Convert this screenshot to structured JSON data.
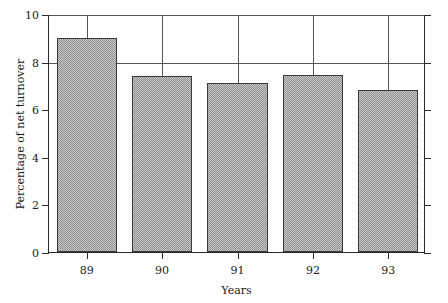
{
  "chart_data": {
    "type": "bar",
    "title": "",
    "subtitle": "",
    "xlabel": "Years",
    "ylabel": "Percentage of net turnover",
    "categories": [
      "89",
      "90",
      "91",
      "92",
      "93"
    ],
    "values": [
      9.0,
      7.4,
      7.1,
      7.45,
      6.8
    ],
    "series": [
      {
        "name": "Percentage of net turnover",
        "values": [
          9.0,
          7.4,
          7.1,
          7.45,
          6.8
        ]
      }
    ],
    "ylim": [
      0,
      10
    ],
    "yticks": [
      0,
      2,
      4,
      6,
      8,
      10
    ],
    "ytick_labels": [
      "0",
      "2",
      "4",
      "6",
      "8",
      "10"
    ],
    "xtick_labels": [
      "89",
      "90",
      "91",
      "92",
      "93"
    ],
    "grid": "both",
    "gridlines_horizontal": [
      8,
      10
    ],
    "gridlines_vertical": [
      "89",
      "90",
      "91",
      "92",
      "93"
    ],
    "legend": null,
    "legend_position": "none",
    "annotations": [],
    "colors": {
      "bar_fill": "#c9c9c9",
      "bar_hatch": "#8f8f8f",
      "bar_edge": "#3a3a3a",
      "axis": "#2a2a2a",
      "grid": "#555555",
      "background": "#ffffff",
      "text": "#1a1a1a"
    }
  }
}
